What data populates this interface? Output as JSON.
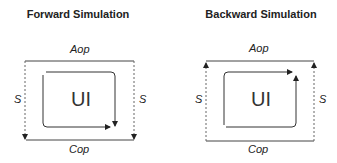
{
  "panels": [
    {
      "title": "Forward Simulation",
      "top_label": "Aop",
      "bottom_label": "Cop",
      "left_label": "S",
      "right_label": "S",
      "center_label": "UI",
      "side_arrow_direction": "down"
    },
    {
      "title": "Backward Simulation",
      "top_label": "Aop",
      "bottom_label": "Cop",
      "left_label": "S",
      "right_label": "S",
      "center_label": "UI",
      "side_arrow_direction": "up"
    }
  ],
  "colors": {
    "line": "#333333",
    "dashed": "#555555"
  }
}
